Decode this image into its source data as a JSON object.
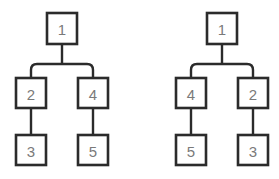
{
  "diagram": {
    "background_color": "#ffffff",
    "node_border_color": "#2b2b2b",
    "node_fill_color": "#ffffff",
    "label_color": "#7a7a7a",
    "edge_color": "#2b2b2b",
    "trees": [
      {
        "name": "left-tree",
        "root": {
          "label": "1",
          "x": 62,
          "y": 28
        },
        "nodes": [
          {
            "id": "L1",
            "label": "1",
            "x": 62,
            "y": 28,
            "level": 0
          },
          {
            "id": "L2",
            "label": "2",
            "x": 31,
            "y": 93,
            "level": 1
          },
          {
            "id": "L4",
            "label": "4",
            "x": 93,
            "y": 93,
            "level": 1
          },
          {
            "id": "L3",
            "label": "3",
            "x": 31,
            "y": 150,
            "level": 2
          },
          {
            "id": "L5",
            "label": "5",
            "x": 93,
            "y": 150,
            "level": 2
          }
        ],
        "edges": [
          {
            "from": "L1",
            "to": "L2"
          },
          {
            "from": "L1",
            "to": "L4"
          },
          {
            "from": "L2",
            "to": "L3"
          },
          {
            "from": "L4",
            "to": "L5"
          }
        ]
      },
      {
        "name": "right-tree",
        "root": {
          "label": "1",
          "x": 222,
          "y": 28
        },
        "nodes": [
          {
            "id": "R1",
            "label": "1",
            "x": 222,
            "y": 28,
            "level": 0
          },
          {
            "id": "R4",
            "label": "4",
            "x": 191,
            "y": 93,
            "level": 1
          },
          {
            "id": "R2",
            "label": "2",
            "x": 253,
            "y": 93,
            "level": 1
          },
          {
            "id": "R5",
            "label": "5",
            "x": 191,
            "y": 150,
            "level": 2
          },
          {
            "id": "R3",
            "label": "3",
            "x": 253,
            "y": 150,
            "level": 2
          }
        ],
        "edges": [
          {
            "from": "R1",
            "to": "R4"
          },
          {
            "from": "R1",
            "to": "R2"
          },
          {
            "from": "R4",
            "to": "R5"
          },
          {
            "from": "R2",
            "to": "R3"
          }
        ]
      }
    ],
    "node_labels": {
      "left_root": "1",
      "left_child_a": "2",
      "left_child_b": "4",
      "left_leaf_a": "3",
      "left_leaf_b": "5",
      "right_root": "1",
      "right_child_a": "4",
      "right_child_b": "2",
      "right_leaf_a": "5",
      "right_leaf_b": "3"
    }
  }
}
